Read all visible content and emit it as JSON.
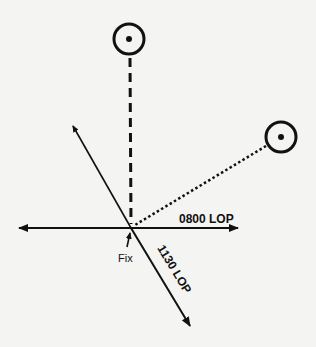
{
  "diagram": {
    "labels": {
      "lop_0800": "0800 LOP",
      "lop_1130": "1130 LOP",
      "fix": "Fix"
    },
    "colors": {
      "ink": "#111111",
      "background": "#f4f4f2"
    }
  }
}
